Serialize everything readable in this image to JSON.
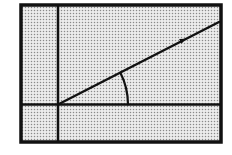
{
  "diagram": {
    "type": "graphing-screen-angle",
    "colors": {
      "background": "#ffffff",
      "screen_fill": "#e9e9e9",
      "dot": "#8a8a8a",
      "ink": "#111111"
    },
    "frame": {
      "x": 21,
      "y": 5,
      "width": 200,
      "height": 137,
      "stroke": 3.5
    },
    "y_axis": {
      "x": 58,
      "y1": 6,
      "y2": 141,
      "stroke": 2.5
    },
    "x_axis": {
      "y": 104.5,
      "x1": 22,
      "x2": 220,
      "stroke": 2.5
    },
    "origin": {
      "x": 58,
      "y": 104.5
    },
    "ray": {
      "x1": 58,
      "y1": 104.5,
      "x2": 219,
      "y2": 22,
      "stroke": 2.5
    },
    "ray_marker": {
      "x": 183,
      "y": 40,
      "type": "arrowhead"
    },
    "angle_arc": {
      "cx": 58,
      "cy": 104.5,
      "r": 70,
      "start_deg": 0,
      "end_deg": 27,
      "stroke": 2.2
    },
    "labels": []
  }
}
